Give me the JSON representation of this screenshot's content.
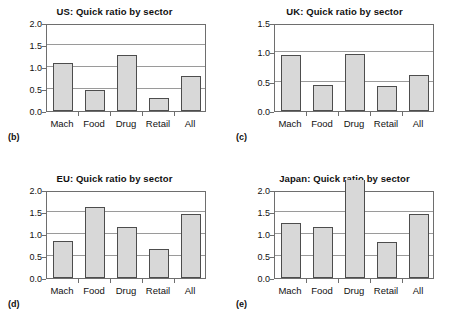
{
  "figure": {
    "background": "#ffffff",
    "bar_fill": "#d8d8d8",
    "bar_edge": "#4d4d4d",
    "grid_color": "#9a9a9a",
    "axis_color": "#6e6e6e"
  },
  "panels": [
    {
      "tag": "(b)",
      "chart_data": {
        "type": "bar",
        "title": "US: Quick ratio by sector",
        "categories": [
          "Mach",
          "Food",
          "Drug",
          "Retail",
          "All"
        ],
        "values": [
          1.1,
          0.48,
          1.28,
          0.3,
          0.8
        ],
        "xlabel": "",
        "ylabel": "",
        "ylim": [
          0.0,
          2.0
        ],
        "yticks": [
          0.0,
          0.5,
          1.0,
          1.5,
          2.0
        ],
        "ytick_labels": [
          "0.0",
          "0.5",
          "1.0",
          "1.5",
          "2.0"
        ],
        "grid": true,
        "legend": "none"
      }
    },
    {
      "tag": "(c)",
      "chart_data": {
        "type": "bar",
        "title": "UK: Quick ratio by sector",
        "categories": [
          "Mach",
          "Food",
          "Drug",
          "Retail",
          "All"
        ],
        "values": [
          0.96,
          0.45,
          0.97,
          0.43,
          0.61
        ],
        "xlabel": "",
        "ylabel": "",
        "ylim": [
          0.0,
          1.5
        ],
        "yticks": [
          0.0,
          0.5,
          1.0,
          1.5
        ],
        "ytick_labels": [
          "0.0",
          "0.5",
          "1.0",
          "1.5"
        ],
        "grid": true,
        "legend": "none"
      }
    },
    {
      "tag": "(d)",
      "chart_data": {
        "type": "bar",
        "title": "EU: Quick ratio by sector",
        "categories": [
          "Mach",
          "Food",
          "Drug",
          "Retail",
          "All"
        ],
        "values": [
          0.83,
          1.61,
          1.17,
          0.66,
          1.46
        ],
        "xlabel": "",
        "ylabel": "",
        "ylim": [
          0.0,
          2.0
        ],
        "yticks": [
          0.0,
          0.5,
          1.0,
          1.5,
          2.0
        ],
        "ytick_labels": [
          "0.0",
          "0.5",
          "1.0",
          "1.5",
          "2.0"
        ],
        "grid": true,
        "legend": "none"
      }
    },
    {
      "tag": "(e)",
      "chart_data": {
        "type": "bar",
        "title": "Japan: Quick ratio by sector",
        "categories": [
          "Mach",
          "Food",
          "Drug",
          "Retail",
          "All"
        ],
        "values": [
          1.24,
          1.17,
          2.18,
          0.82,
          1.46
        ],
        "clipped": [
          false,
          false,
          true,
          false,
          false
        ],
        "xlabel": "",
        "ylabel": "",
        "ylim": [
          0.0,
          2.0
        ],
        "yticks": [
          0.0,
          0.5,
          1.0,
          1.5,
          2.0
        ],
        "ytick_labels": [
          "0.0",
          "0.5",
          "1.0",
          "1.5",
          "2.0"
        ],
        "grid": true,
        "legend": "none"
      }
    }
  ]
}
